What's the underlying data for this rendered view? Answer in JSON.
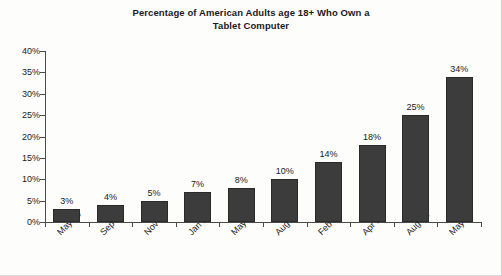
{
  "chart_data": {
    "type": "bar",
    "title": "Percentage of American Adults age 18+ Who Own a Tablet Computer",
    "title_line1": "Percentage of American Adults age 18+ Who Own a",
    "title_line2": "Tablet Computer",
    "xlabel": "",
    "ylabel": "",
    "ylim": [
      0,
      40
    ],
    "grid": false,
    "legend": "none",
    "categories": [
      "May 10",
      "Sep 10",
      "Nov 10",
      "Jan 11",
      "May 11",
      "Aug 11",
      "Feb 12",
      "Apr 12",
      "Aug 12",
      "May 13"
    ],
    "values": [
      3,
      4,
      5,
      7,
      8,
      10,
      14,
      18,
      25,
      34
    ],
    "data_labels": [
      "3%",
      "4%",
      "5%",
      "7%",
      "8%",
      "10%",
      "14%",
      "18%",
      "25%",
      "34%"
    ],
    "y_ticks": [
      0,
      5,
      10,
      15,
      20,
      25,
      30,
      35,
      40
    ],
    "y_tick_labels": [
      "0%",
      "5%",
      "10%",
      "15%",
      "20%",
      "25%",
      "30%",
      "35%",
      "40%"
    ],
    "bar_color": "#3c3c3c",
    "bar_border_color": "#2a2a2a",
    "axis_color": "#4a4a4a",
    "background_color": "#fdfdfc",
    "text_color": "#1a1a1a"
  }
}
